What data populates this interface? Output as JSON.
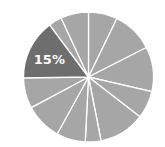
{
  "chart_data": {
    "type": "pie",
    "title": "",
    "center": [
      88.5,
      77
    ],
    "radius": 65,
    "start_angle_deg": 0,
    "direction": "clockwise",
    "values": [
      7.2,
      10.3,
      11.1,
      6.9,
      11.4,
      3.9,
      7.2,
      9.2,
      7.6,
      15,
      3.3,
      6.9
    ],
    "highlight_index": 9,
    "labels": [
      "",
      "",
      "",
      "",
      "",
      "",
      "",
      "",
      "",
      "15%",
      "",
      ""
    ],
    "colors": {
      "default": "#a6a6a6",
      "highlight": "#6e6e6e",
      "separator": "#ffffff",
      "label": "#ffffff"
    },
    "legend": null
  },
  "highlight_label": "15%"
}
